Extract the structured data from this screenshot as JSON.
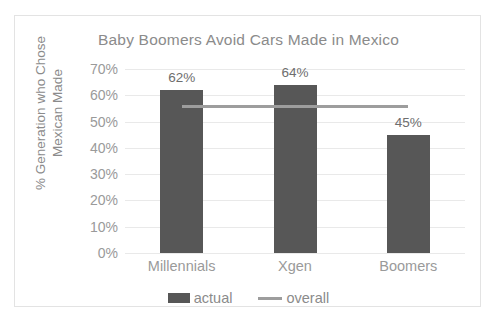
{
  "chart_data": {
    "type": "bar",
    "title": "Baby Boomers Avoid Cars Made in Mexico",
    "xlabel": "",
    "ylabel": "% Generation who Chose Mexican Made",
    "ylabel_line1": "% Generation who Chose",
    "ylabel_line2": "Mexican Made",
    "categories": [
      "Millennials",
      "Xgen",
      "Boomers"
    ],
    "series": [
      {
        "name": "actual",
        "type": "bar",
        "values": [
          62,
          64,
          45
        ],
        "value_labels": [
          "62%",
          "64%",
          "45%"
        ],
        "color": "#575757"
      },
      {
        "name": "overall",
        "type": "line",
        "values": [
          56,
          56,
          56
        ],
        "color": "#9d9d9d"
      }
    ],
    "ylim": [
      0,
      70
    ],
    "ytick_values": [
      70,
      60,
      50,
      40,
      30,
      20,
      10,
      0
    ],
    "ytick_labels": [
      "70%",
      "60%",
      "50%",
      "40%",
      "30%",
      "20%",
      "10%",
      "0%"
    ],
    "grid": true,
    "legend_position": "bottom",
    "legend_entries": [
      "actual",
      "overall"
    ],
    "background_color": "#ffffff",
    "border_color": "#e3e3e3",
    "gridline_color": "#e9e9e9",
    "text_color": "#8b8b8b"
  }
}
